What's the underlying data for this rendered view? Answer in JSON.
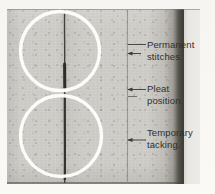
{
  "figure": {
    "description_labels": [
      {
        "id": "permanent-stitches",
        "line1": "Permanent",
        "line2": "stitches."
      },
      {
        "id": "pleat-position",
        "line1": "Pleat",
        "line2": "position."
      },
      {
        "id": "temporary-tacking",
        "line1": "Temporary",
        "line2": "tacking."
      }
    ],
    "colors": {
      "page": "#f8f7f4",
      "fabric": "#cccac5",
      "fold_shadow": "#47443e",
      "fold_highlight": "#e9e7e3",
      "highlight_circle": "#fdfdfb",
      "leader_line": "#4b4842",
      "label_text": "#31302c",
      "stitch_line": "#3a3832",
      "pleat_line": "#8c8981"
    }
  }
}
